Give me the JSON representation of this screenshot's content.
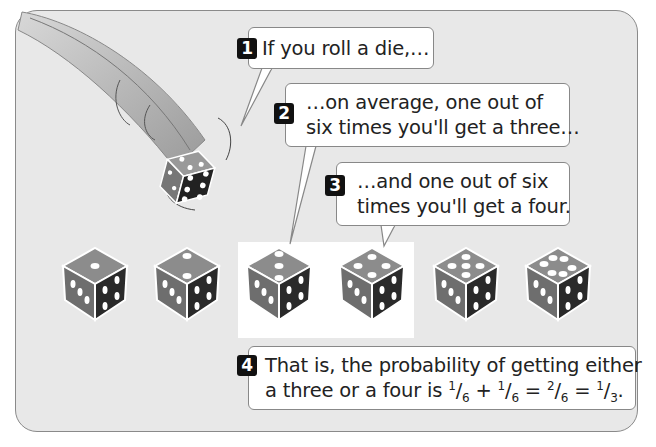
{
  "steps": [
    {
      "number": "1",
      "line1": "If you roll a die,…"
    },
    {
      "number": "2",
      "line1": "…on average, one out of",
      "line2": "six times you'll get a three…"
    },
    {
      "number": "3",
      "line1": "…and one out of six",
      "line2": "times you'll get a four."
    },
    {
      "number": "4",
      "line1": "That is, the probability of getting either",
      "line2_prefix": "a three or a four is ",
      "fractions": [
        {
          "num": "1",
          "den": "6"
        },
        {
          "op": " + "
        },
        {
          "num": "1",
          "den": "6"
        },
        {
          "op": " = "
        },
        {
          "num": "2",
          "den": "6"
        },
        {
          "op": " = "
        },
        {
          "num": "1",
          "den": "3",
          "suffix": "."
        }
      ]
    }
  ],
  "dice": [
    {
      "face": 1,
      "highlighted": false
    },
    {
      "face": 2,
      "highlighted": false
    },
    {
      "face": 3,
      "highlighted": true
    },
    {
      "face": 4,
      "highlighted": true
    },
    {
      "face": 5,
      "highlighted": false
    },
    {
      "face": 6,
      "highlighted": false
    }
  ],
  "colors": {
    "panel_bg": "#e8e8e8",
    "die_top": "#8c8c8c",
    "die_left": "#6e6e6e",
    "die_right": "#2a2a2a",
    "number_badge": "#111111"
  }
}
